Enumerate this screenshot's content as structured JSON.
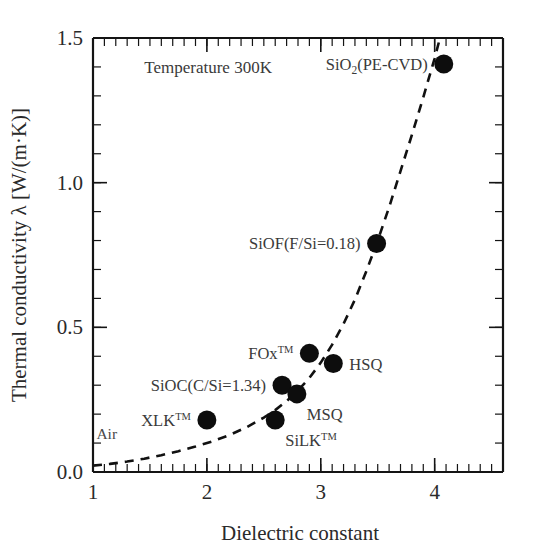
{
  "chart_data": {
    "type": "scatter",
    "title": "",
    "xlabel": "Dielectric constant",
    "ylabel": "Thermal conductivity λ [W/(m·K)]",
    "xlim": [
      1,
      4.6
    ],
    "ylim": [
      0.0,
      1.5
    ],
    "grid": false,
    "legend": "none",
    "xticks": [
      1,
      2,
      3,
      4
    ],
    "xtick_labels": [
      "1",
      "2",
      "3",
      "4"
    ],
    "xtick_minor_step": 0.1,
    "yticks": [
      0.0,
      0.5,
      1.0,
      1.5
    ],
    "ytick_labels": [
      "0.0",
      "0.5",
      "1.0",
      "1.5"
    ],
    "ytick_minor_step": 0.1,
    "annotations": [
      {
        "name": "temperature-note",
        "text": "Temperature 300K",
        "x": 1.45,
        "y": 1.38
      },
      {
        "name": "air-note",
        "text": "Air",
        "x": 1.03,
        "y": 0.115
      }
    ],
    "points": [
      {
        "name": "XLK",
        "label": "XLK",
        "label_sup": "TM",
        "label_sub": "",
        "label_tail": "",
        "x": 2.0,
        "y": 0.18,
        "label_pos": "left"
      },
      {
        "name": "SiLK",
        "label": "SiLK",
        "label_sup": "TM",
        "label_sub": "",
        "label_tail": "",
        "x": 2.6,
        "y": 0.18,
        "label_pos": "below-right"
      },
      {
        "name": "SiOC",
        "label": "SiOC",
        "label_sup": "",
        "label_sub": "",
        "label_tail": "(C/Si=1.34)",
        "x": 2.66,
        "y": 0.3,
        "label_pos": "left"
      },
      {
        "name": "MSQ",
        "label": "MSQ",
        "label_sup": "",
        "label_sub": "",
        "label_tail": "",
        "x": 2.79,
        "y": 0.27,
        "label_pos": "below-right"
      },
      {
        "name": "FOx",
        "label": "FOx",
        "label_sup": "TM",
        "label_sub": "",
        "label_tail": "",
        "x": 2.9,
        "y": 0.41,
        "label_pos": "left"
      },
      {
        "name": "HSQ",
        "label": "HSQ",
        "label_sup": "",
        "label_sub": "",
        "label_tail": "",
        "x": 3.11,
        "y": 0.375,
        "label_pos": "right"
      },
      {
        "name": "SiOF",
        "label": "SiOF",
        "label_sup": "",
        "label_sub": "",
        "label_tail": "(F/Si=0.18)",
        "x": 3.49,
        "y": 0.79,
        "label_pos": "left"
      },
      {
        "name": "SiO2-PECVD",
        "label": "SiO",
        "label_sup": "",
        "label_sub": "2",
        "label_tail": "(PE-CVD)",
        "x": 4.08,
        "y": 1.41,
        "label_pos": "left"
      }
    ],
    "fit_curve": {
      "name": "trend-line",
      "style": "dashed",
      "points": [
        [
          1.0,
          0.022
        ],
        [
          1.15,
          0.028
        ],
        [
          1.3,
          0.036
        ],
        [
          1.45,
          0.046
        ],
        [
          1.6,
          0.058
        ],
        [
          1.75,
          0.072
        ],
        [
          1.9,
          0.088
        ],
        [
          2.05,
          0.106
        ],
        [
          2.2,
          0.128
        ],
        [
          2.35,
          0.155
        ],
        [
          2.5,
          0.188
        ],
        [
          2.6,
          0.214
        ],
        [
          2.7,
          0.245
        ],
        [
          2.8,
          0.282
        ],
        [
          2.9,
          0.325
        ],
        [
          3.0,
          0.378
        ],
        [
          3.1,
          0.44
        ],
        [
          3.2,
          0.512
        ],
        [
          3.3,
          0.596
        ],
        [
          3.4,
          0.694
        ],
        [
          3.5,
          0.8
        ],
        [
          3.6,
          0.915
        ],
        [
          3.7,
          1.04
        ],
        [
          3.8,
          1.165
        ],
        [
          3.9,
          1.295
        ],
        [
          4.0,
          1.43
        ],
        [
          4.04,
          1.49
        ]
      ]
    }
  },
  "labels": {
    "xaxis": "Dielectric constant",
    "yaxis": "Thermal conductivity λ [W/(m·K)]",
    "temperature": "Temperature 300K",
    "air": "Air"
  }
}
